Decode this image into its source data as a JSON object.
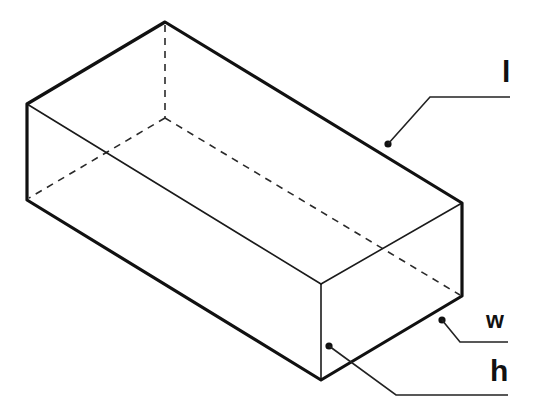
{
  "diagram": {
    "colors": {
      "background": "#ffffff",
      "line": "#111111"
    },
    "vertices": {
      "top_back": [
        165,
        22
      ],
      "left_top": [
        27,
        104
      ],
      "left_bottom": [
        27,
        200
      ],
      "front_top": [
        321,
        284
      ],
      "front_bottom": [
        321,
        380
      ],
      "right_top": [
        462,
        203
      ],
      "right_bottom": [
        462,
        296
      ],
      "hidden_back_bottom": [
        165,
        118
      ]
    },
    "labels": {
      "length": {
        "text": "l",
        "meaning": "length",
        "dot": [
          388,
          144
        ],
        "leader_bend": [
          430,
          97
        ],
        "leader_end": [
          510,
          97
        ]
      },
      "width": {
        "text": "w",
        "meaning": "width",
        "dot": [
          442,
          320
        ],
        "leader_bend": [
          460,
          342
        ],
        "leader_end": [
          508,
          342
        ]
      },
      "height": {
        "text": "h",
        "meaning": "height",
        "dot": [
          329,
          346
        ],
        "leader_bend": [
          396,
          395
        ],
        "leader_end": [
          508,
          395
        ]
      }
    }
  }
}
